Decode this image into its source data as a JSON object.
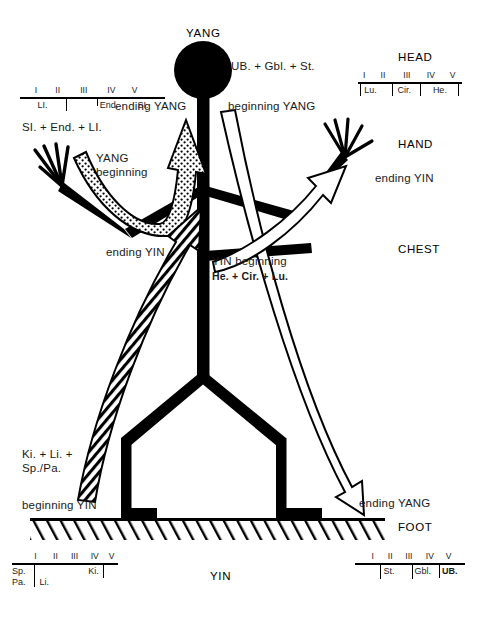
{
  "diagram": {
    "title_top": "YANG",
    "title_bottom": "YIN"
  },
  "regions": {
    "head": "HEAD",
    "hand": "HAND",
    "chest": "CHEST",
    "foot": "FOOT"
  },
  "flow_labels": {
    "ub_gbl_st": "UB. + Gbl. + St.",
    "beginning_yang": "beginning YANG",
    "ending_yang_top": "ending YANG",
    "si_end_li": "SI. + End. + LI.",
    "yang_beginning_1": "YANG",
    "yang_beginning_2": "beginning",
    "ending_yin_left": "ending YIN",
    "yin_beginning": "YIN beginning",
    "he_cir_lu": "He. + Cir. + Lu.",
    "ending_yin_right": "ending YIN",
    "ki_li_1": "Ki. + Li. +",
    "ki_li_2": "Sp./Pa.",
    "beginning_yin": "beginning YIN",
    "ending_yang_bottom": "ending YANG"
  },
  "scales": {
    "head": {
      "romans": [
        "I",
        "II",
        "III",
        "IV",
        "V"
      ],
      "labels": [
        "Lu.",
        "Cir.",
        "He."
      ]
    },
    "arm_upper_left": {
      "romans": [
        "I",
        "II",
        "III",
        "IV",
        "V"
      ],
      "labels": [
        "LI.",
        "End.",
        "SI."
      ]
    },
    "foot_left": {
      "romans": [
        "I",
        "II",
        "III",
        "IV",
        "V"
      ],
      "labels": [
        "Sp.",
        "Pa.",
        "Li.",
        "Ki."
      ]
    },
    "foot_right": {
      "romans": [
        "I",
        "II",
        "III",
        "IV",
        "V"
      ],
      "labels": [
        "St.",
        "Gbl.",
        "UB."
      ]
    }
  },
  "colors": {
    "ink": "#000000",
    "text": "#1a1a1a",
    "paper": "#ffffff"
  }
}
